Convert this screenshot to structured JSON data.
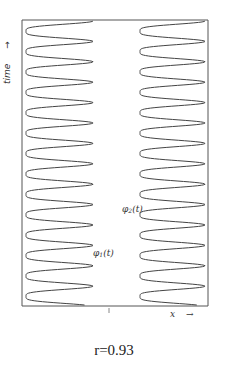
{
  "figure": {
    "y_axis_label": "time",
    "y_axis_arrow": "→",
    "x_axis_label": "x",
    "x_axis_arrow": "→",
    "curves": [
      {
        "id": "phi1",
        "symbol": "φ",
        "subscript": "1",
        "arg": "(t)"
      },
      {
        "id": "phi2",
        "symbol": "φ",
        "subscript": "2",
        "arg": "(t)"
      }
    ],
    "caption": "r=0.93",
    "colors": {
      "line": "#444444",
      "frame": "#555555",
      "background": "#ffffff"
    },
    "frame": {
      "x0": 22,
      "y0": 20,
      "x1": 208,
      "y1": 306
    },
    "waves": {
      "left": {
        "x_min": 26,
        "x_max": 93,
        "period_px": 20.4,
        "cycles": 14
      },
      "right": {
        "x_min": 140,
        "x_max": 205,
        "period_px": 20.4,
        "cycles": 14
      }
    },
    "center_tick_x": 109
  }
}
